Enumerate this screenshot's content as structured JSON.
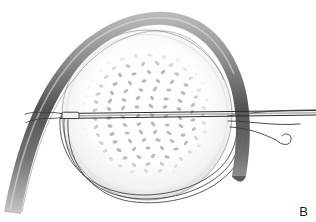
{
  "figure": {
    "domain": "medical-surgical-illustration",
    "panel_label": "B",
    "title": "",
    "caption": "",
    "background_color": "#ffffff",
    "ink_color": "#2b2b2b",
    "parts": [
      {
        "name": "globe",
        "label": "",
        "shape": "circle",
        "center_x": 147,
        "center_y": 115,
        "radius": 85,
        "fill": "#fdfdfd",
        "stroke": "#9a9a9a",
        "description": "large pale spherical body with soft shaded rim"
      },
      {
        "name": "stippled-mass",
        "label": "",
        "shape": "circle",
        "center_x": 147,
        "center_y": 114,
        "radius": 63,
        "dot_color": "#b4b4b4",
        "dot_count": 230,
        "description": "dense field of short oblique gray speckles filling the central disc"
      },
      {
        "name": "curved-band",
        "label": "",
        "shape": "arc",
        "stroke_dark": "#4f4f4f",
        "stroke_light": "#c9c9c9",
        "description": "thick dark shaded band arching over the top of the globe, fading at lower left and tapering to a point at lower right"
      },
      {
        "name": "horizontal-suture",
        "label": "",
        "shape": "line",
        "x1": 60,
        "y1": 116,
        "x2": 316,
        "y2": 112,
        "stroke": "#2b2b2b",
        "description": "straight suture passing horizontally through the globe"
      },
      {
        "name": "suture-swage",
        "label": "",
        "shape": "rect",
        "x": 62,
        "y": 112,
        "width": 17,
        "height": 6,
        "description": "small needle swage / knot node at the left end of the horizontal suture"
      },
      {
        "name": "encircling-loops",
        "label": "",
        "shape": "arcs",
        "count": 3,
        "stroke": "#3a3a3a",
        "description": "three thin concentric suture strands looping around the lower half of the globe"
      },
      {
        "name": "free-suture-tails",
        "label": "",
        "shape": "strands",
        "count": 3,
        "stroke": "#3a3a3a",
        "description": "three suture strands trailing off to the right edge with a small U-shaped curl"
      }
    ]
  }
}
